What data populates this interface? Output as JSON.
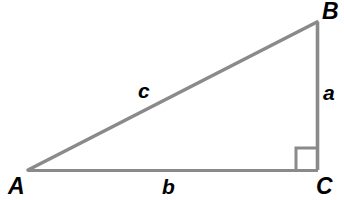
{
  "diagram": {
    "type": "right-triangle",
    "background_color": "#ffffff",
    "stroke_color": "#8a8a8a",
    "label_color": "#000000",
    "stroke_width": 3.5,
    "canvas": {
      "width": 344,
      "height": 200
    },
    "vertices": [
      {
        "id": "A",
        "label": "A",
        "x": 28,
        "y": 170,
        "label_x": 8,
        "label_y": 175
      },
      {
        "id": "B",
        "label": "B",
        "x": 317,
        "y": 22,
        "label_x": 322,
        "label_y": 0
      },
      {
        "id": "C",
        "label": "C",
        "x": 317,
        "y": 170,
        "label_x": 316,
        "label_y": 175
      }
    ],
    "sides": [
      {
        "id": "a",
        "label": "a",
        "from": "B",
        "to": "C",
        "role": "vertical-leg",
        "label_x": 323,
        "label_y": 82
      },
      {
        "id": "b",
        "label": "b",
        "from": "A",
        "to": "C",
        "role": "horizontal-leg",
        "label_x": 162,
        "label_y": 176
      },
      {
        "id": "c",
        "label": "c",
        "from": "A",
        "to": "B",
        "role": "hypotenuse",
        "label_x": 138,
        "label_y": 80
      }
    ],
    "right_angle": {
      "at_vertex": "C",
      "marker": "square",
      "x": 296,
      "y": 148,
      "width": 22,
      "height": 22
    }
  }
}
